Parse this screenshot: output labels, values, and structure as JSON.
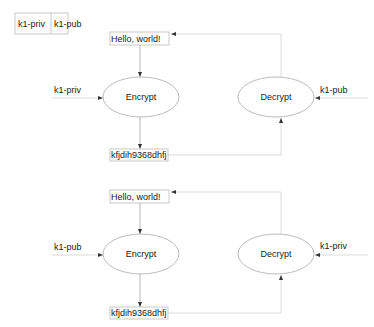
{
  "key_table": {
    "cells": [
      "k1-priv",
      "k1-pub"
    ]
  },
  "diagrams": [
    {
      "plaintext": "Hello, world!",
      "encrypt_label": "Encrypt",
      "encrypt_key": "k1-priv",
      "ciphertext": "kfjdih9368dhfj",
      "decrypt_label": "Decrypt",
      "decrypt_key": "k1-pub"
    },
    {
      "plaintext": "Hello, world!",
      "encrypt_label": "Encrypt",
      "encrypt_key": "k1-pub",
      "ciphertext": "kfjdih9368dhfj",
      "decrypt_label": "Decrypt",
      "decrypt_key": "k1-priv"
    }
  ],
  "colors": {
    "line": "#999999",
    "border": "#bbbbbb",
    "text": "#222222"
  }
}
